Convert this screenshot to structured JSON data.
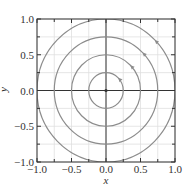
{
  "chart_data": {
    "type": "line",
    "title": "",
    "xlabel": "x",
    "ylabel": "y",
    "xlim": [
      -1.0,
      1.0
    ],
    "ylim": [
      -1.0,
      1.0
    ],
    "grid": true,
    "xticks": [
      -1.0,
      -0.5,
      0.0,
      0.5,
      1.0
    ],
    "yticks": [
      -1.0,
      -0.5,
      0.0,
      0.5,
      1.0
    ],
    "xtick_labels": [
      "−1.0",
      "−0.5",
      "0.0",
      "0.5",
      "1.0"
    ],
    "ytick_labels": [
      "−1.0",
      "−0.5",
      "0.0",
      "0.5",
      "1.0"
    ],
    "minor_ticks": [
      -0.75,
      -0.25,
      0.25,
      0.75
    ],
    "center_point": [
      0.0,
      0.0
    ],
    "series": [
      {
        "name": "circle r=0.25",
        "radius": 0.25,
        "arrow_angle_deg": 45,
        "direction": "counterclockwise"
      },
      {
        "name": "circle r=0.5",
        "radius": 0.5,
        "arrow_angle_deg": 45,
        "direction": "counterclockwise"
      },
      {
        "name": "circle r=0.75",
        "radius": 0.75,
        "arrow_angle_deg": 45,
        "direction": "counterclockwise"
      },
      {
        "name": "circle r=1.0",
        "radius": 1.0,
        "arrow_angle_deg": 45,
        "direction": "counterclockwise"
      }
    ],
    "colors": {
      "curve": "#8c8c8c",
      "axes": "#333333",
      "grid": "#e0e0e0",
      "center_lines": "#333333"
    }
  }
}
